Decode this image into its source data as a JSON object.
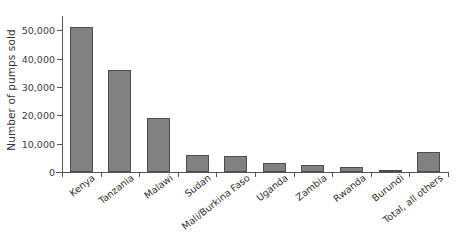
{
  "chart_data": {
    "type": "bar",
    "title": "",
    "xlabel": "",
    "ylabel": "Number of pumps sold",
    "categories": [
      "Kenya",
      "Tanzania",
      "Malawi",
      "Sudan",
      "Mali/Burkina Faso",
      "Uganda",
      "Zambia",
      "Rwanda",
      "Burundi",
      "Total, all others"
    ],
    "values": [
      51000,
      36000,
      19000,
      6000,
      5500,
      3200,
      2300,
      1600,
      600,
      6900
    ],
    "ylim": [
      0,
      55000
    ],
    "ytick_values": [
      0,
      10000,
      20000,
      30000,
      40000,
      50000
    ],
    "ytick_labels": [
      "0",
      "10,000",
      "20,000",
      "30,000",
      "40,000",
      "50,000"
    ],
    "grid": false,
    "legend": "none",
    "bar_color": "#818181",
    "bar_edge_color": "#4d4d4d",
    "axis_color": "#555555",
    "text_color": "#333333"
  }
}
